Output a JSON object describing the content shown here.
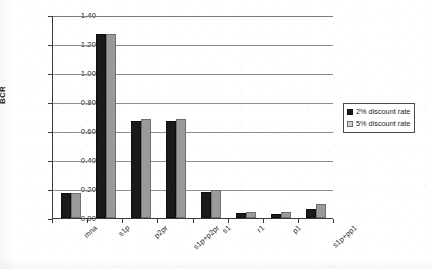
{
  "chart_data": {
    "type": "bar",
    "title": "",
    "xlabel": "",
    "ylabel": "BCR",
    "ylim": [
      0,
      1.4
    ],
    "ytick_step": 0.2,
    "yticks": [
      "0.00",
      "0.20",
      "0.40",
      "0.60",
      "0.80",
      "1.00",
      "1.20",
      "1.40"
    ],
    "grid": true,
    "legend_position": "right",
    "categories": [
      "mna",
      "s1p",
      "p2pr",
      "s1p+p2pr",
      "s1",
      "r1",
      "p1",
      "s1p+pp1"
    ],
    "series": [
      {
        "name": "2% discount rate",
        "color": "#1a1a1a",
        "values": [
          0.17,
          1.27,
          0.67,
          0.67,
          0.18,
          0.035,
          0.03,
          0.06
        ]
      },
      {
        "name": "5% discount rate",
        "color": "#9a9a9a",
        "values": [
          0.17,
          1.27,
          0.68,
          0.68,
          0.19,
          0.04,
          0.04,
          0.1
        ]
      }
    ]
  },
  "legend": {
    "items": [
      {
        "label": "2% discount rate"
      },
      {
        "label": "5% discount rate"
      }
    ]
  },
  "colors": {
    "series_2pct": "#1a1a1a",
    "series_5pct": "#9a9a9a",
    "axis": "#3a3a3a",
    "gridline": "#8e8e8e",
    "background": "#ffffff"
  }
}
